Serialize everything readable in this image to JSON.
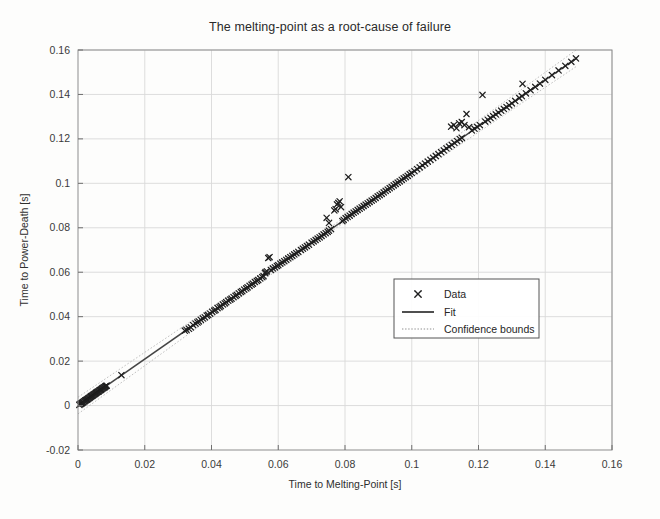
{
  "figure": {
    "background_color": "#fdfdfc",
    "axes_color": "#8d8d8d",
    "grid_color": "#d9d9d9",
    "marker_color": "#1f1f1f",
    "fit_color": "#454545",
    "confidence_color": "#b9b9b9"
  },
  "chart_data": {
    "type": "scatter",
    "title": "The melting-point as a root-cause of failure",
    "xlabel": "Time to Melting-Point [s]",
    "ylabel": "Time to Power-Death [s]",
    "xlim": [
      0,
      0.16
    ],
    "ylim": [
      -0.02,
      0.16
    ],
    "xticks": [
      0,
      0.02,
      0.04,
      0.06,
      0.08,
      0.1,
      0.12,
      0.14,
      0.16
    ],
    "xticklabels": [
      "0",
      "0.02",
      "0.04",
      "0.06",
      "0.08",
      "0.1",
      "0.12",
      "0.14",
      "0.16"
    ],
    "yticks": [
      -0.02,
      0,
      0.02,
      0.04,
      0.06,
      0.08,
      0.1,
      0.12,
      0.14,
      0.16
    ],
    "yticklabels": [
      "-0.02",
      "0",
      "0.02",
      "0.04",
      "0.06",
      "0.08",
      "0.1",
      "0.12",
      "0.14",
      "0.16"
    ],
    "grid": true,
    "legend_position": "center-right",
    "legend": [
      {
        "label": "Data",
        "style": "marker-x"
      },
      {
        "label": "Fit",
        "style": "solid-line"
      },
      {
        "label": "Confidence bounds",
        "style": "dotted-line"
      }
    ],
    "series": [
      {
        "name": "Fit",
        "type": "line",
        "slope": 1.047,
        "intercept": 0.0,
        "x": [
          0.0,
          0.1495
        ],
        "y": [
          0.0,
          0.1565
        ]
      },
      {
        "name": "Confidence bounds",
        "type": "line-pair",
        "offset": 0.0022
      },
      {
        "name": "Data",
        "type": "scatter",
        "points": [
          [
            0.0004,
            0.0003
          ],
          [
            0.0006,
            0.0006
          ],
          [
            0.0008,
            0.0008
          ],
          [
            0.001,
            0.001
          ],
          [
            0.0012,
            0.0011
          ],
          [
            0.0014,
            0.0014
          ],
          [
            0.0016,
            0.0015
          ],
          [
            0.0018,
            0.0019
          ],
          [
            0.002,
            0.002
          ],
          [
            0.0022,
            0.0023
          ],
          [
            0.0024,
            0.0024
          ],
          [
            0.0026,
            0.0027
          ],
          [
            0.0028,
            0.0028
          ],
          [
            0.003,
            0.0031
          ],
          [
            0.0032,
            0.0033
          ],
          [
            0.0034,
            0.0035
          ],
          [
            0.0036,
            0.0037
          ],
          [
            0.0038,
            0.004
          ],
          [
            0.004,
            0.0042
          ],
          [
            0.0042,
            0.0044
          ],
          [
            0.0044,
            0.0046
          ],
          [
            0.0046,
            0.0048
          ],
          [
            0.0048,
            0.005
          ],
          [
            0.005,
            0.0052
          ],
          [
            0.0052,
            0.0054
          ],
          [
            0.0054,
            0.0057
          ],
          [
            0.0056,
            0.0059
          ],
          [
            0.0058,
            0.0061
          ],
          [
            0.006,
            0.0063
          ],
          [
            0.0062,
            0.0064
          ],
          [
            0.0064,
            0.0067
          ],
          [
            0.0066,
            0.0069
          ],
          [
            0.0068,
            0.0071
          ],
          [
            0.007,
            0.0073
          ],
          [
            0.0072,
            0.0076
          ],
          [
            0.0074,
            0.0078
          ],
          [
            0.0076,
            0.008
          ],
          [
            0.0078,
            0.0082
          ],
          [
            0.008,
            0.0083
          ],
          [
            0.0082,
            0.0086
          ],
          [
            0.0084,
            0.0088
          ],
          [
            0.0086,
            0.009
          ],
          [
            0.013,
            0.0137
          ],
          [
            0.032,
            0.0337
          ],
          [
            0.0325,
            0.0341
          ],
          [
            0.0332,
            0.0346
          ],
          [
            0.0338,
            0.0352
          ],
          [
            0.0345,
            0.0362
          ],
          [
            0.0352,
            0.0369
          ],
          [
            0.0358,
            0.0374
          ],
          [
            0.0362,
            0.0379
          ],
          [
            0.0368,
            0.0386
          ],
          [
            0.0374,
            0.0392
          ],
          [
            0.038,
            0.0397
          ],
          [
            0.0386,
            0.0405
          ],
          [
            0.039,
            0.0408
          ],
          [
            0.0396,
            0.0414
          ],
          [
            0.0402,
            0.0422
          ],
          [
            0.0408,
            0.0427
          ],
          [
            0.0412,
            0.0431
          ],
          [
            0.0418,
            0.0439
          ],
          [
            0.0424,
            0.0443
          ],
          [
            0.0428,
            0.0448
          ],
          [
            0.0434,
            0.0455
          ],
          [
            0.044,
            0.046
          ],
          [
            0.0444,
            0.0465
          ],
          [
            0.045,
            0.0472
          ],
          [
            0.0456,
            0.0477
          ],
          [
            0.046,
            0.0481
          ],
          [
            0.0466,
            0.0488
          ],
          [
            0.0472,
            0.0494
          ],
          [
            0.0476,
            0.0498
          ],
          [
            0.0482,
            0.0505
          ],
          [
            0.0488,
            0.0511
          ],
          [
            0.0492,
            0.0515
          ],
          [
            0.0498,
            0.0522
          ],
          [
            0.0504,
            0.0527
          ],
          [
            0.0508,
            0.0532
          ],
          [
            0.0514,
            0.0539
          ],
          [
            0.052,
            0.0544
          ],
          [
            0.0524,
            0.0549
          ],
          [
            0.053,
            0.0556
          ],
          [
            0.0536,
            0.0561
          ],
          [
            0.054,
            0.0565
          ],
          [
            0.0546,
            0.0572
          ],
          [
            0.0552,
            0.0578
          ],
          [
            0.0556,
            0.0582
          ],
          [
            0.056,
            0.0596
          ],
          [
            0.0562,
            0.06
          ],
          [
            0.0566,
            0.0604
          ],
          [
            0.057,
            0.0664
          ],
          [
            0.0574,
            0.0668
          ],
          [
            0.0578,
            0.061
          ],
          [
            0.0584,
            0.0617
          ],
          [
            0.059,
            0.0622
          ],
          [
            0.0596,
            0.0628
          ],
          [
            0.06,
            0.0632
          ],
          [
            0.0606,
            0.0639
          ],
          [
            0.0612,
            0.0644
          ],
          [
            0.0618,
            0.065
          ],
          [
            0.0624,
            0.0656
          ],
          [
            0.063,
            0.0662
          ],
          [
            0.0636,
            0.0668
          ],
          [
            0.0642,
            0.0674
          ],
          [
            0.0648,
            0.068
          ],
          [
            0.0654,
            0.0686
          ],
          [
            0.066,
            0.0692
          ],
          [
            0.0668,
            0.07
          ],
          [
            0.0674,
            0.0706
          ],
          [
            0.068,
            0.0712
          ],
          [
            0.0686,
            0.0718
          ],
          [
            0.0692,
            0.0724
          ],
          [
            0.07,
            0.0733
          ],
          [
            0.0706,
            0.0739
          ],
          [
            0.0712,
            0.0745
          ],
          [
            0.0718,
            0.0751
          ],
          [
            0.0724,
            0.0757
          ],
          [
            0.073,
            0.0763
          ],
          [
            0.0736,
            0.077
          ],
          [
            0.0742,
            0.0776
          ],
          [
            0.0748,
            0.0782
          ],
          [
            0.0752,
            0.0787
          ],
          [
            0.0758,
            0.0794
          ],
          [
            0.0745,
            0.0845
          ],
          [
            0.0752,
            0.0822
          ],
          [
            0.0768,
            0.0878
          ],
          [
            0.0772,
            0.0884
          ],
          [
            0.0776,
            0.0905
          ],
          [
            0.078,
            0.0912
          ],
          [
            0.0784,
            0.0919
          ],
          [
            0.0788,
            0.0893
          ],
          [
            0.0792,
            0.083
          ],
          [
            0.0796,
            0.0836
          ],
          [
            0.0802,
            0.0843
          ],
          [
            0.0808,
            0.0849
          ],
          [
            0.081,
            0.1028
          ],
          [
            0.0814,
            0.0855
          ],
          [
            0.082,
            0.0862
          ],
          [
            0.0826,
            0.0868
          ],
          [
            0.0832,
            0.0874
          ],
          [
            0.0838,
            0.088
          ],
          [
            0.0844,
            0.0886
          ],
          [
            0.085,
            0.0892
          ],
          [
            0.0856,
            0.0898
          ],
          [
            0.0862,
            0.0904
          ],
          [
            0.0868,
            0.091
          ],
          [
            0.0874,
            0.0916
          ],
          [
            0.088,
            0.0922
          ],
          [
            0.0886,
            0.0928
          ],
          [
            0.0892,
            0.0934
          ],
          [
            0.0898,
            0.0941
          ],
          [
            0.0904,
            0.0947
          ],
          [
            0.091,
            0.0953
          ],
          [
            0.0916,
            0.0959
          ],
          [
            0.0922,
            0.0966
          ],
          [
            0.0928,
            0.0972
          ],
          [
            0.0934,
            0.0978
          ],
          [
            0.094,
            0.0984
          ],
          [
            0.0946,
            0.0991
          ],
          [
            0.0952,
            0.0997
          ],
          [
            0.0958,
            0.1003
          ],
          [
            0.0964,
            0.1009
          ],
          [
            0.097,
            0.1016
          ],
          [
            0.0976,
            0.1022
          ],
          [
            0.0982,
            0.1028
          ],
          [
            0.0988,
            0.1034
          ],
          [
            0.0994,
            0.1041
          ],
          [
            0.1,
            0.1047
          ],
          [
            0.1008,
            0.1055
          ],
          [
            0.1016,
            0.1064
          ],
          [
            0.1024,
            0.1072
          ],
          [
            0.1032,
            0.1081
          ],
          [
            0.104,
            0.1089
          ],
          [
            0.1048,
            0.1098
          ],
          [
            0.1056,
            0.1106
          ],
          [
            0.1064,
            0.1115
          ],
          [
            0.1072,
            0.1123
          ],
          [
            0.108,
            0.1131
          ],
          [
            0.1088,
            0.114
          ],
          [
            0.1096,
            0.1148
          ],
          [
            0.1104,
            0.1157
          ],
          [
            0.1112,
            0.1165
          ],
          [
            0.112,
            0.1173
          ],
          [
            0.1128,
            0.1182
          ],
          [
            0.1136,
            0.119
          ],
          [
            0.1144,
            0.1199
          ],
          [
            0.115,
            0.1205
          ],
          [
            0.1118,
            0.1255
          ],
          [
            0.1126,
            0.1262
          ],
          [
            0.1134,
            0.1248
          ],
          [
            0.1142,
            0.127
          ],
          [
            0.115,
            0.1276
          ],
          [
            0.1158,
            0.1262
          ],
          [
            0.1164,
            0.1312
          ],
          [
            0.1172,
            0.1253
          ],
          [
            0.118,
            0.1238
          ],
          [
            0.1188,
            0.1246
          ],
          [
            0.1196,
            0.1254
          ],
          [
            0.1204,
            0.1262
          ],
          [
            0.1212,
            0.1398
          ],
          [
            0.122,
            0.1278
          ],
          [
            0.1228,
            0.1286
          ],
          [
            0.1236,
            0.1294
          ],
          [
            0.1244,
            0.1302
          ],
          [
            0.1252,
            0.131
          ],
          [
            0.126,
            0.1318
          ],
          [
            0.1268,
            0.1327
          ],
          [
            0.1276,
            0.1335
          ],
          [
            0.1284,
            0.1343
          ],
          [
            0.1292,
            0.1351
          ],
          [
            0.13,
            0.136
          ],
          [
            0.131,
            0.1371
          ],
          [
            0.1322,
            0.1384
          ],
          [
            0.133,
            0.1392
          ],
          [
            0.1332,
            0.1448
          ],
          [
            0.1342,
            0.1405
          ],
          [
            0.1356,
            0.1419
          ],
          [
            0.137,
            0.1434
          ],
          [
            0.1384,
            0.1449
          ],
          [
            0.14,
            0.1466
          ],
          [
            0.142,
            0.1487
          ],
          [
            0.144,
            0.1508
          ],
          [
            0.146,
            0.1529
          ],
          [
            0.1478,
            0.1547
          ],
          [
            0.1492,
            0.1562
          ]
        ]
      }
    ]
  }
}
